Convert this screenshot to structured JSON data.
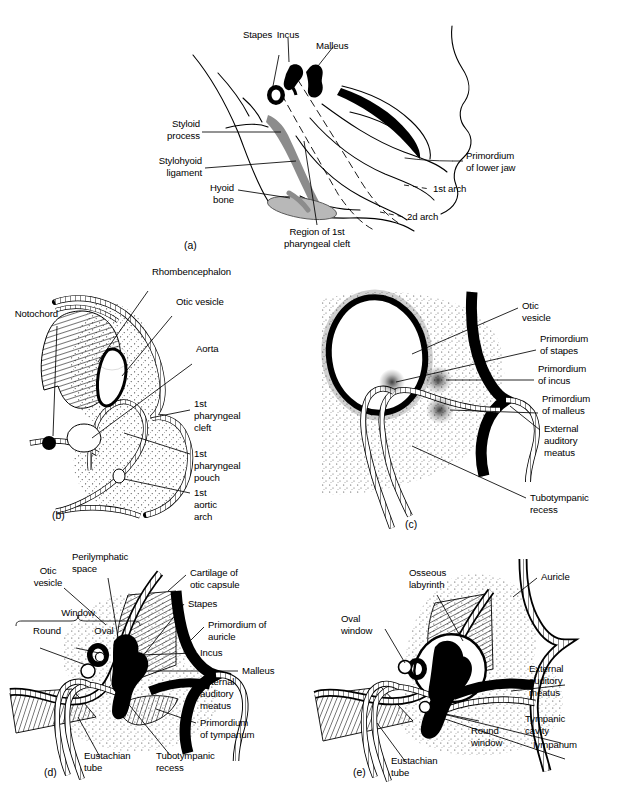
{
  "figure": {
    "background": "#ffffff",
    "ink": "#000000",
    "grey_bone": "#8c8c8c",
    "light_grey": "#b8b8b8"
  },
  "panels": [
    {
      "id": "a",
      "letter": "(a)",
      "labels": [
        {
          "key": "incus",
          "text": "Incus"
        },
        {
          "key": "malleus",
          "text": "Malleus"
        },
        {
          "key": "stapes",
          "text": "Stapes"
        },
        {
          "key": "styloid",
          "text": "Styloid\nprocess"
        },
        {
          "key": "stylohyoid",
          "text": "Stylohyoid\nligament"
        },
        {
          "key": "hyoid",
          "text": "Hyoid\nbone"
        },
        {
          "key": "cleft1",
          "text": "Region of 1st\npharyngeal cleft"
        },
        {
          "key": "primordium_jaw",
          "text": "Primordium\nof lower jaw"
        },
        {
          "key": "arch1",
          "text": "1st arch"
        },
        {
          "key": "arch2",
          "text": "2d arch"
        }
      ]
    },
    {
      "id": "b",
      "letter": "(b)",
      "labels": [
        {
          "key": "rhomb",
          "text": "Rhombencephalon"
        },
        {
          "key": "otic",
          "text": "Otic vesicle"
        },
        {
          "key": "notochord",
          "text": "Notochord"
        },
        {
          "key": "aorta",
          "text": "Aorta"
        },
        {
          "key": "cleft",
          "text": "1st\npharyngeal\ncleft"
        },
        {
          "key": "pouch",
          "text": "1st\npharyngeal\npouch"
        },
        {
          "key": "aortic",
          "text": "1st\naortic\narch"
        }
      ]
    },
    {
      "id": "c",
      "letter": "(c)",
      "labels": [
        {
          "key": "otic",
          "text": "Otic\nvesicle"
        },
        {
          "key": "stapes",
          "text": "Primordium\nof stapes"
        },
        {
          "key": "incus",
          "text": "Primordium\nof incus"
        },
        {
          "key": "malleus",
          "text": "Primordium\nof malleus"
        },
        {
          "key": "eam",
          "text": "External\nauditory\nmeatus"
        },
        {
          "key": "tubo",
          "text": "Tubotympanic\nrecess"
        }
      ]
    },
    {
      "id": "d",
      "letter": "(d)",
      "labels": [
        {
          "key": "otic",
          "text": "Otic\nvesicle"
        },
        {
          "key": "peri",
          "text": "Perilymphatic\nspace"
        },
        {
          "key": "cartilage",
          "text": "Cartilage of\notic capsule"
        },
        {
          "key": "stapes",
          "text": "Stapes"
        },
        {
          "key": "auricle",
          "text": "Primordium of\nauricle"
        },
        {
          "key": "incus",
          "text": "Incus"
        },
        {
          "key": "malleus",
          "text": "Malleus"
        },
        {
          "key": "eam",
          "text": "External\nauditory\nmeatus"
        },
        {
          "key": "tympanum",
          "text": "Primordium\nof tympanum"
        },
        {
          "key": "window",
          "text": "Window"
        },
        {
          "key": "round",
          "text": "Round"
        },
        {
          "key": "oval",
          "text": "Oval"
        },
        {
          "key": "eustachian",
          "text": "Eustachian\ntube"
        },
        {
          "key": "tubo",
          "text": "Tubotympanic\nrecess"
        }
      ]
    },
    {
      "id": "e",
      "letter": "(e)",
      "labels": [
        {
          "key": "osseous",
          "text": "Osseous\nlabyrinth"
        },
        {
          "key": "auricle",
          "text": "Auricle"
        },
        {
          "key": "oval",
          "text": "Oval\nwindow"
        },
        {
          "key": "eam",
          "text": "External\nauditory\nmeatus"
        },
        {
          "key": "tympanic",
          "text": "Tympanic\ncavity"
        },
        {
          "key": "tympanum",
          "text": "Iympanum"
        },
        {
          "key": "round",
          "text": "Round\nwindow"
        },
        {
          "key": "eustachian",
          "text": "Eustachian\ntube"
        }
      ]
    }
  ],
  "text": {
    "a": {
      "incus": "Incus",
      "malleus": "Malleus",
      "stapes": "Stapes",
      "styloid_l1": "Styloid",
      "styloid_l2": "process",
      "stylohyoid_l1": "Stylohyoid",
      "stylohyoid_l2": "ligament",
      "hyoid_l1": "Hyoid",
      "hyoid_l2": "bone",
      "cleft_l1": "Region of 1st",
      "cleft_l2": "pharyngeal cleft",
      "jaw_l1": "Primordium",
      "jaw_l2": "of lower jaw",
      "arch1": "1st arch",
      "arch2": "2d arch",
      "letter": "(a)"
    },
    "b": {
      "rhomb": "Rhombencephalon",
      "otic": "Otic vesicle",
      "notochord": "Notochord",
      "aorta": "Aorta",
      "cleft_l1": "1st",
      "cleft_l2": "pharyngeal",
      "cleft_l3": "cleft",
      "pouch_l1": "1st",
      "pouch_l2": "pharyngeal",
      "pouch_l3": "pouch",
      "aortic_l1": "1st",
      "aortic_l2": "aortic",
      "aortic_l3": "arch",
      "letter": "(b)"
    },
    "c": {
      "otic_l1": "Otic",
      "otic_l2": "vesicle",
      "stapes_l1": "Primordium",
      "stapes_l2": "of stapes",
      "incus_l1": "Primordium",
      "incus_l2": "of incus",
      "malleus_l1": "Primordium",
      "malleus_l2": "of malleus",
      "eam_l1": "External",
      "eam_l2": "auditory",
      "eam_l3": "meatus",
      "tubo_l1": "Tubotympanic",
      "tubo_l2": "recess",
      "letter": "(c)"
    },
    "d": {
      "otic_l1": "Otic",
      "otic_l2": "vesicle",
      "peri_l1": "Perilymphatic",
      "peri_l2": "space",
      "cart_l1": "Cartilage of",
      "cart_l2": "otic capsule",
      "stapes": "Stapes",
      "auricle_l1": "Primordium of",
      "auricle_l2": "auricle",
      "incus": "Incus",
      "malleus": "Malleus",
      "eam_l1": "External",
      "eam_l2": "auditory",
      "eam_l3": "meatus",
      "tymp_l1": "Primordium",
      "tymp_l2": "of tympanum",
      "window": "Window",
      "round": "Round",
      "oval": "Oval",
      "eust_l1": "Eustachian",
      "eust_l2": "tube",
      "tubo_l1": "Tubotympanic",
      "tubo_l2": "recess",
      "letter": "(d)"
    },
    "e": {
      "oss_l1": "Osseous",
      "oss_l2": "labyrinth",
      "auricle": "Auricle",
      "oval_l1": "Oval",
      "oval_l2": "window",
      "eam_l1": "External",
      "eam_l2": "auditory",
      "eam_l3": "meatus",
      "tc_l1": "Tympanic",
      "tc_l2": "cavity",
      "tympanum": "Iympanum",
      "round_l1": "Round",
      "round_l2": "window",
      "eust_l1": "Eustachian",
      "eust_l2": "tube",
      "letter": "(e)"
    }
  }
}
